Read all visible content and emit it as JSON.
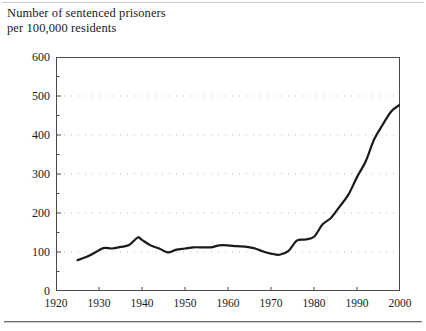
{
  "chart_data": {
    "type": "line",
    "title": "Number of sentenced prisoners per 100,000 residents",
    "title_lines": [
      "Number of sentenced prisoners",
      "per 100,000 residents"
    ],
    "xlabel": "",
    "ylabel": "",
    "xlim": [
      1920,
      2000
    ],
    "ylim": [
      0,
      600
    ],
    "xticks": [
      1920,
      1930,
      1940,
      1950,
      1960,
      1970,
      1980,
      1990,
      2000
    ],
    "xtick_labels": [
      "1920",
      "1930",
      "1940",
      "1950",
      "1960",
      "1970",
      "1980",
      "1990",
      "2000"
    ],
    "yticks": [
      0,
      100,
      200,
      300,
      400,
      500,
      600
    ],
    "ytick_labels": [
      "0",
      "100",
      "200",
      "300",
      "400",
      "500",
      "600"
    ],
    "y_minor_tick_step": 50,
    "grid": "horizontal-dotted",
    "grid_color": "#b9b9b9",
    "legend": null,
    "line_color": "#1a1a1a",
    "line_width": 2.2,
    "series": [
      {
        "name": "Sentenced prisoners per 100,000 residents",
        "x": [
          1925,
          1927,
          1929,
          1931,
          1933,
          1935,
          1937,
          1939,
          1940,
          1942,
          1944,
          1946,
          1948,
          1950,
          1952,
          1954,
          1956,
          1958,
          1960,
          1962,
          1964,
          1966,
          1968,
          1970,
          1972,
          1974,
          1976,
          1978,
          1980,
          1982,
          1984,
          1986,
          1988,
          1990,
          1992,
          1994,
          1996,
          1998,
          2000
        ],
        "values": [
          79,
          87,
          98,
          110,
          109,
          113,
          118,
          137,
          131,
          117,
          109,
          99,
          106,
          109,
          112,
          112,
          112,
          117,
          117,
          115,
          114,
          110,
          102,
          96,
          93,
          102,
          129,
          132,
          139,
          171,
          188,
          217,
          247,
          292,
          332,
          389,
          427,
          461,
          478
        ]
      }
    ]
  }
}
